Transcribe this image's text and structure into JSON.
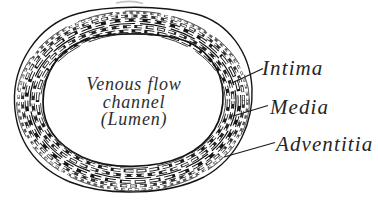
{
  "diagram": {
    "lumen": {
      "line1": "Venous flow",
      "line2": "channel",
      "line3": "(Lumen)"
    },
    "labels": [
      {
        "name": "Intima"
      },
      {
        "name": "Media"
      },
      {
        "name": "Adventitia"
      }
    ],
    "colors": {
      "ink": "#1a1a1a",
      "text": "#2e2e2e",
      "background": "#ffffff"
    }
  }
}
